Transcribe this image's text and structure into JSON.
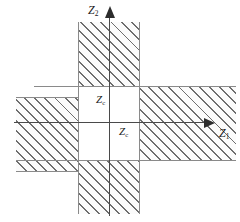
{
  "figure": {
    "background_color": "#ffffff",
    "hatch_color": "#6e6e6e",
    "axis_color": "#2d2d2d",
    "band_edge_color": "#8a8a8a"
  },
  "axes": {
    "horizontal": {
      "name": "Z1",
      "base": "Z",
      "subscript": "1",
      "direction": "right",
      "arrowhead": true
    },
    "vertical": {
      "name": "Z2",
      "base": "Z",
      "subscript": "2",
      "direction": "up",
      "arrowhead": true
    }
  },
  "annotations": [
    {
      "id": "zc-upper-left",
      "base": "Z",
      "subscript": "c",
      "text": "Zc"
    },
    {
      "id": "zc-lower-right",
      "base": "Z",
      "subscript": "c",
      "text": "Zc"
    }
  ],
  "regions": [
    {
      "id": "vertical-band",
      "description": "hatched vertical strip along Z2 axis",
      "orientation": "vertical",
      "hatch": "45deg"
    },
    {
      "id": "horizontal-band",
      "description": "hatched horizontal strip along Z1 axis",
      "orientation": "horizontal",
      "hatch": "45deg"
    },
    {
      "id": "center-square",
      "description": "unhatched intersection square at the origin",
      "orientation": "none",
      "hatch": "none"
    }
  ]
}
